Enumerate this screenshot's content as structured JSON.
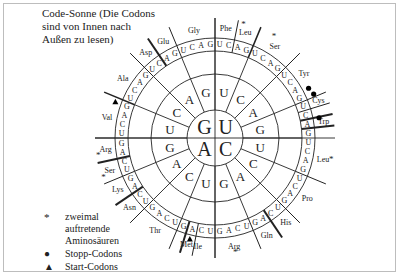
{
  "title": "Code-Sonne (Die Codons sind von Innen nach Außen zu lesen)",
  "title_lines": [
    "Code-Sonne (Die Codons",
    "sind von Innen nach",
    "Außen zu lesen)"
  ],
  "legend": {
    "twice": {
      "symbol": "*",
      "lines": [
        "zweimal",
        "auftretende",
        "Aminosäuren"
      ]
    },
    "stop": {
      "symbol": "●",
      "label": "Stopp-Codons"
    },
    "start": {
      "symbol": "▲",
      "label": "Start-Codons"
    }
  },
  "center": {
    "first_bases": [
      "G",
      "U",
      "A",
      "C"
    ]
  },
  "second_ring": {
    "G": [
      "U",
      "C",
      "A",
      "G"
    ],
    "U": [
      "G",
      "U",
      "C",
      "A"
    ],
    "C": [
      "U",
      "C",
      "A",
      "G"
    ],
    "A": [
      "A",
      "G",
      "U",
      "C"
    ]
  },
  "amino_acids": [
    "Gly",
    "Phe",
    "Leu",
    "Ser",
    "Tyr",
    "Cys",
    "Trp",
    "Leu",
    "Pro",
    "His",
    "Gln",
    "Arg",
    "Ile",
    "Met",
    "Thr",
    "Asn",
    "Lys",
    "Ser",
    "Arg",
    "Val",
    "Ala",
    "Asp",
    "Glu"
  ],
  "colors": {
    "line": "#222222",
    "frame": "#bdbdbd",
    "background": "#ffffff"
  }
}
